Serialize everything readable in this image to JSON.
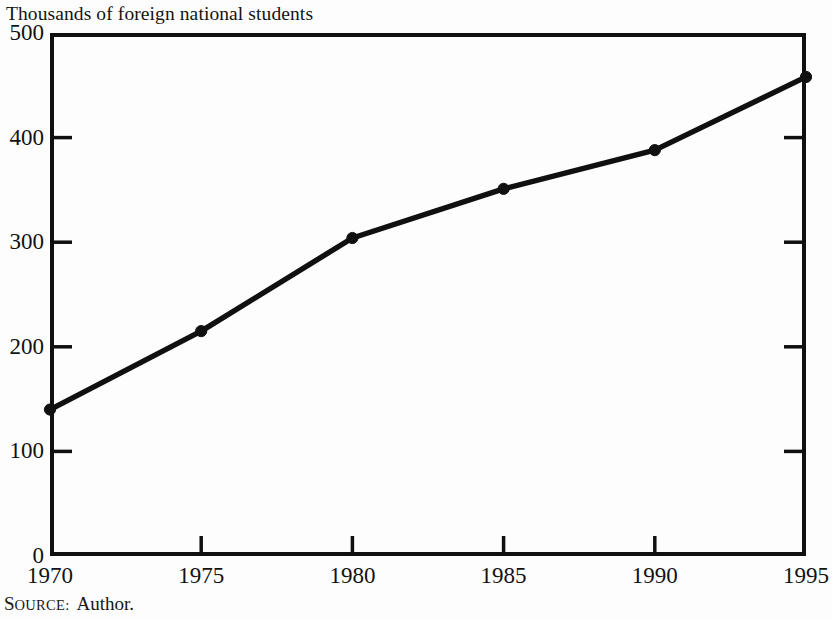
{
  "chart_data": {
    "type": "line",
    "title": "Thousands of foreign national students",
    "xlabel": "",
    "ylabel": "",
    "x": [
      1970,
      1975,
      1980,
      1985,
      1990,
      1995
    ],
    "values": [
      140,
      215,
      304,
      351,
      388,
      458
    ],
    "categories": [
      "1970",
      "1975",
      "1980",
      "1985",
      "1990",
      "1995"
    ],
    "xlim": [
      1970,
      1995
    ],
    "ylim": [
      0,
      500
    ],
    "ytick_labels": [
      "0",
      "100",
      "200",
      "300",
      "400",
      "500"
    ],
    "ytick_values": [
      0,
      100,
      200,
      300,
      400,
      500
    ],
    "xtick_labels": [
      "1970",
      "1975",
      "1980",
      "1985",
      "1990",
      "1995"
    ],
    "xtick_values": [
      1970,
      1975,
      1980,
      1985,
      1990,
      1995
    ],
    "grid": false,
    "legend": null,
    "marker": "circle",
    "line_color": "#101010",
    "marker_color": "#101010",
    "background_color": "#fdfdfd",
    "series": [
      {
        "name": "Foreign national students",
        "values": [
          140,
          215,
          304,
          351,
          388,
          458
        ]
      }
    ]
  },
  "figure": {
    "title": "Thousands of foreign national students",
    "source_label_lead": "S",
    "source_label_rest": "OURCE:",
    "source_value": "Author."
  }
}
